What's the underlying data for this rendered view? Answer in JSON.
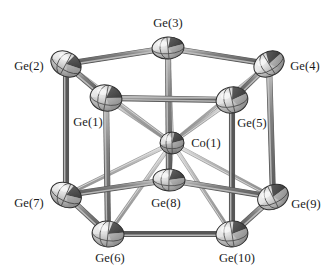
{
  "figure": {
    "background_color": "#ffffff",
    "label_color": "#1a1a1a",
    "bond_color": "#6e6e6e",
    "bond_color_light": "#a8a8a8",
    "ellipsoid_light": "#f2f2f2",
    "ellipsoid_mid": "#9a9a9a",
    "ellipsoid_dark": "#3a3a3a",
    "width": 334,
    "height": 276
  },
  "atoms": [
    {
      "id": "ge3",
      "label": "Ge(3)",
      "element": "Ge",
      "cx": 168,
      "cy": 48,
      "rx": 16,
      "ry": 11,
      "rot": -4,
      "kind": "ge",
      "z": 6,
      "label_x": 168,
      "label_y": 23,
      "label_anchor": "center"
    },
    {
      "id": "ge2",
      "label": "Ge(2)",
      "element": "Ge",
      "cx": 66,
      "cy": 64,
      "rx": 16,
      "ry": 12,
      "rot": 30,
      "kind": "ge",
      "z": 5,
      "label_x": 29,
      "label_y": 66,
      "label_anchor": "center"
    },
    {
      "id": "ge4",
      "label": "Ge(4)",
      "element": "Ge",
      "cx": 269,
      "cy": 64,
      "rx": 16,
      "ry": 12,
      "rot": -30,
      "kind": "ge",
      "z": 5,
      "label_x": 305,
      "label_y": 66,
      "label_anchor": "center"
    },
    {
      "id": "ge1",
      "label": "Ge(1)",
      "element": "Ge",
      "cx": 106,
      "cy": 98,
      "rx": 16,
      "ry": 13,
      "rot": 12,
      "kind": "ge",
      "z": 9,
      "label_x": 88,
      "label_y": 122,
      "label_anchor": "center"
    },
    {
      "id": "ge5",
      "label": "Ge(5)",
      "element": "Ge",
      "cx": 232,
      "cy": 100,
      "rx": 16,
      "ry": 13,
      "rot": -12,
      "kind": "ge",
      "z": 9,
      "label_x": 252,
      "label_y": 123,
      "label_anchor": "center"
    },
    {
      "id": "co1",
      "label": "Co(1)",
      "element": "Co",
      "cx": 172,
      "cy": 143,
      "rx": 12,
      "ry": 11,
      "rot": 0,
      "kind": "co",
      "z": 10,
      "label_x": 206,
      "label_y": 143,
      "label_anchor": "center"
    },
    {
      "id": "ge8",
      "label": "Ge(8)",
      "element": "Ge",
      "cx": 169,
      "cy": 180,
      "rx": 16,
      "ry": 11,
      "rot": 3,
      "kind": "ge",
      "z": 11,
      "label_x": 166,
      "label_y": 203,
      "label_anchor": "center"
    },
    {
      "id": "ge7",
      "label": "Ge(7)",
      "element": "Ge",
      "cx": 66,
      "cy": 195,
      "rx": 16,
      "ry": 12,
      "rot": 25,
      "kind": "ge",
      "z": 7,
      "label_x": 29,
      "label_y": 203,
      "label_anchor": "center"
    },
    {
      "id": "ge9",
      "label": "Ge(9)",
      "element": "Ge",
      "cx": 273,
      "cy": 197,
      "rx": 16,
      "ry": 12,
      "rot": -25,
      "kind": "ge",
      "z": 7,
      "label_x": 306,
      "label_y": 204,
      "label_anchor": "center"
    },
    {
      "id": "ge6",
      "label": "Ge(6)",
      "element": "Ge",
      "cx": 108,
      "cy": 234,
      "rx": 16,
      "ry": 13,
      "rot": 8,
      "kind": "ge",
      "z": 8,
      "label_x": 110,
      "label_y": 258,
      "label_anchor": "center"
    },
    {
      "id": "ge10",
      "label": "Ge(10)",
      "element": "Ge",
      "cx": 232,
      "cy": 234,
      "rx": 16,
      "ry": 13,
      "rot": -8,
      "kind": "ge",
      "z": 8,
      "label_x": 237,
      "label_y": 258,
      "label_anchor": "center"
    }
  ],
  "bonds": {
    "top_ring": [
      {
        "from": "ge2",
        "to": "ge3",
        "style": "dark"
      },
      {
        "from": "ge3",
        "to": "ge4",
        "style": "dark"
      },
      {
        "from": "ge2",
        "to": "ge1",
        "style": "dark"
      },
      {
        "from": "ge1",
        "to": "ge5",
        "style": "dark"
      },
      {
        "from": "ge5",
        "to": "ge4",
        "style": "dark"
      }
    ],
    "bottom_ring": [
      {
        "from": "ge7",
        "to": "ge6",
        "style": "dark"
      },
      {
        "from": "ge6",
        "to": "ge10",
        "style": "dark"
      },
      {
        "from": "ge10",
        "to": "ge9",
        "style": "dark"
      },
      {
        "from": "ge7",
        "to": "ge8",
        "style": "dark"
      },
      {
        "from": "ge8",
        "to": "ge9",
        "style": "dark"
      }
    ],
    "vertical": [
      {
        "from": "ge2",
        "to": "ge7",
        "style": "dark"
      },
      {
        "from": "ge3",
        "to": "ge8",
        "style": "dark"
      },
      {
        "from": "ge4",
        "to": "ge9",
        "style": "dark"
      },
      {
        "from": "ge1",
        "to": "ge6",
        "style": "dark"
      },
      {
        "from": "ge5",
        "to": "ge10",
        "style": "dark"
      }
    ],
    "central": [
      {
        "from": "co1",
        "to": "ge1",
        "style": "light"
      },
      {
        "from": "co1",
        "to": "ge2",
        "style": "light"
      },
      {
        "from": "co1",
        "to": "ge3",
        "style": "light"
      },
      {
        "from": "co1",
        "to": "ge4",
        "style": "light"
      },
      {
        "from": "co1",
        "to": "ge5",
        "style": "light"
      },
      {
        "from": "co1",
        "to": "ge6",
        "style": "light"
      },
      {
        "from": "co1",
        "to": "ge7",
        "style": "light"
      },
      {
        "from": "co1",
        "to": "ge8",
        "style": "light"
      },
      {
        "from": "co1",
        "to": "ge9",
        "style": "light"
      },
      {
        "from": "co1",
        "to": "ge10",
        "style": "light"
      }
    ]
  }
}
